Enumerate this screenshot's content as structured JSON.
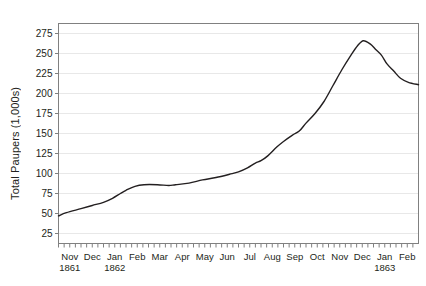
{
  "chart_data": {
    "type": "line",
    "title": "",
    "xlabel": "",
    "ylabel": "Total Paupers (1,000s)",
    "ylim": [
      12.5,
      287.5
    ],
    "yticks": [
      25,
      50,
      75,
      100,
      125,
      150,
      175,
      200,
      225,
      250,
      275
    ],
    "grid": true,
    "legend": "none",
    "line_color": "#231f20",
    "axis_color": "#808080",
    "grid_color": "#e8e8e8",
    "x_axis": {
      "minor_ticks": "weekly",
      "months": [
        {
          "label": "Nov",
          "year": "1861"
        },
        {
          "label": "Dec",
          "year": ""
        },
        {
          "label": "Jan",
          "year": "1862"
        },
        {
          "label": "Feb",
          "year": ""
        },
        {
          "label": "Mar",
          "year": ""
        },
        {
          "label": "Apr",
          "year": ""
        },
        {
          "label": "May",
          "year": ""
        },
        {
          "label": "Jun",
          "year": ""
        },
        {
          "label": "Jul",
          "year": ""
        },
        {
          "label": "Aug",
          "year": ""
        },
        {
          "label": "Sep",
          "year": ""
        },
        {
          "label": "Oct",
          "year": ""
        },
        {
          "label": "Nov",
          "year": ""
        },
        {
          "label": "Dec",
          "year": ""
        },
        {
          "label": "Jan",
          "year": "1863"
        },
        {
          "label": "Feb",
          "year": ""
        }
      ]
    },
    "x": [
      "Nov 1861",
      "Dec 1861",
      "Jan 1862",
      "Feb 1862",
      "Mar 1862",
      "Apr 1862",
      "May 1862",
      "Jun 1862",
      "Jul 1862",
      "Aug 1862",
      "Sep 1862",
      "Oct 1862",
      "Nov 1862",
      "Dec 1862",
      "Jan 1863",
      "Feb 1863"
    ],
    "series": [
      {
        "name": "Total Paupers",
        "values": [
          47,
          56,
          64,
          79,
          85,
          85,
          89,
          95,
          102,
          113,
          140,
          163,
          205,
          262,
          245,
          213
        ]
      }
    ],
    "points": [
      {
        "x": 0.0,
        "y": 47
      },
      {
        "x": 0.35,
        "y": 51
      },
      {
        "x": 1.0,
        "y": 56
      },
      {
        "x": 1.5,
        "y": 60
      },
      {
        "x": 2.0,
        "y": 64
      },
      {
        "x": 2.4,
        "y": 69
      },
      {
        "x": 2.75,
        "y": 75
      },
      {
        "x": 3.0,
        "y": 79
      },
      {
        "x": 3.4,
        "y": 84
      },
      {
        "x": 3.8,
        "y": 86
      },
      {
        "x": 4.4,
        "y": 86
      },
      {
        "x": 4.9,
        "y": 85
      },
      {
        "x": 5.2,
        "y": 86
      },
      {
        "x": 5.8,
        "y": 88
      },
      {
        "x": 6.4,
        "y": 92
      },
      {
        "x": 7.0,
        "y": 95
      },
      {
        "x": 7.6,
        "y": 99
      },
      {
        "x": 8.0,
        "y": 102
      },
      {
        "x": 8.4,
        "y": 107
      },
      {
        "x": 8.75,
        "y": 113
      },
      {
        "x": 9.0,
        "y": 116
      },
      {
        "x": 9.3,
        "y": 122
      },
      {
        "x": 9.7,
        "y": 133
      },
      {
        "x": 10.0,
        "y": 140
      },
      {
        "x": 10.4,
        "y": 148
      },
      {
        "x": 10.7,
        "y": 153
      },
      {
        "x": 11.0,
        "y": 163
      },
      {
        "x": 11.4,
        "y": 175
      },
      {
        "x": 11.8,
        "y": 190
      },
      {
        "x": 12.2,
        "y": 210
      },
      {
        "x": 12.6,
        "y": 230
      },
      {
        "x": 13.0,
        "y": 248
      },
      {
        "x": 13.3,
        "y": 260
      },
      {
        "x": 13.55,
        "y": 266
      },
      {
        "x": 13.85,
        "y": 262
      },
      {
        "x": 14.1,
        "y": 255
      },
      {
        "x": 14.35,
        "y": 248
      },
      {
        "x": 14.6,
        "y": 237
      },
      {
        "x": 14.9,
        "y": 228
      },
      {
        "x": 15.2,
        "y": 219
      },
      {
        "x": 15.55,
        "y": 214
      },
      {
        "x": 16.0,
        "y": 211
      }
    ],
    "peak": {
      "label": "Dec 1862",
      "value": 266
    },
    "start": {
      "label": "Nov 1861",
      "value": 47
    },
    "end": {
      "label": "Feb 1863",
      "value": 211
    }
  }
}
